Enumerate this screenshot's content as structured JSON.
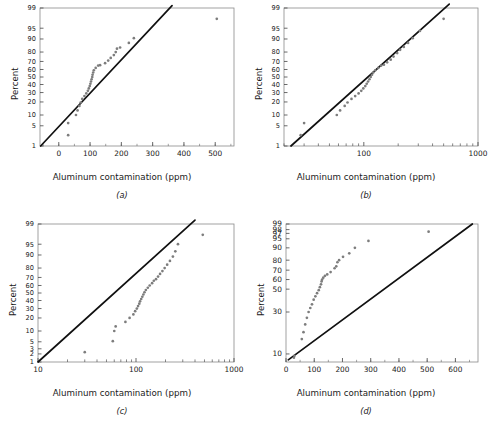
{
  "figure": {
    "axis_label_x": "Aluminum contamination (ppm)",
    "axis_label_y": "Percent",
    "marker_color": "#7d7d7d",
    "line_color": "#111111",
    "frame_color": "#8a8a8a",
    "background": "#ffffff"
  },
  "panels": [
    {
      "id": "a",
      "caption": "(a)",
      "chart_data": {
        "type": "scatter",
        "title": "",
        "xlabel": "Aluminum contamination (ppm)",
        "ylabel": "Percent",
        "x_scale": "linear",
        "y_scale": "normal-probability",
        "xlim": [
          -60,
          560
        ],
        "ylim": [
          1,
          99
        ],
        "grid": false,
        "legend": "none",
        "x_ticks": [
          0,
          100,
          200,
          300,
          400,
          500
        ],
        "x_tick_labels": [
          "0",
          "100",
          "200",
          "300",
          "400",
          "500"
        ],
        "y_ticks": [
          1,
          5,
          10,
          20,
          30,
          40,
          50,
          60,
          70,
          80,
          90,
          95,
          99
        ],
        "y_tick_labels": [
          "1",
          "5",
          "10",
          "20",
          "30",
          "40",
          "50",
          "60",
          "70",
          "80",
          "90",
          "95",
          "99"
        ],
        "points": [
          [
            30,
            2.5
          ],
          [
            30,
            6.0
          ],
          [
            55,
            10.0
          ],
          [
            60,
            13.0
          ],
          [
            66,
            16.5
          ],
          [
            70,
            19.5
          ],
          [
            75,
            23.0
          ],
          [
            82,
            26.0
          ],
          [
            88,
            29.0
          ],
          [
            93,
            32.0
          ],
          [
            96,
            35.0
          ],
          [
            99,
            38.0
          ],
          [
            101,
            41.0
          ],
          [
            103,
            44.0
          ],
          [
            105,
            47.0
          ],
          [
            107,
            50.0
          ],
          [
            108,
            53.0
          ],
          [
            110,
            56.0
          ],
          [
            112,
            59.0
          ],
          [
            118,
            62.0
          ],
          [
            126,
            65.0
          ],
          [
            132,
            65.5
          ],
          [
            148,
            68.0
          ],
          [
            158,
            71.0
          ],
          [
            166,
            74.0
          ],
          [
            176,
            77.0
          ],
          [
            182,
            80.0
          ],
          [
            186,
            83.0
          ],
          [
            196,
            84.0
          ],
          [
            224,
            87.5
          ],
          [
            240,
            90.5
          ],
          [
            505,
            97.5
          ]
        ],
        "fit_line": {
          "x0": -58,
          "y0": 1.0,
          "x1": 362,
          "y1": 99.2
        }
      }
    },
    {
      "id": "b",
      "caption": "(b)",
      "chart_data": {
        "type": "scatter",
        "title": "",
        "xlabel": "Aluminum contamination (ppm)",
        "ylabel": "Percent",
        "x_scale": "log",
        "y_scale": "normal-probability",
        "xlim": [
          20,
          1000
        ],
        "ylim": [
          1,
          99
        ],
        "grid": false,
        "legend": "none",
        "x_ticks": [
          100,
          1000
        ],
        "x_tick_labels": [
          "100",
          "1000"
        ],
        "y_ticks": [
          1,
          5,
          10,
          20,
          30,
          40,
          50,
          60,
          70,
          80,
          90,
          95,
          99
        ],
        "y_tick_labels": [
          "1",
          "5",
          "10",
          "20",
          "30",
          "40",
          "50",
          "60",
          "70",
          "80",
          "90",
          "95",
          "99"
        ],
        "points": [
          [
            28,
            2.5
          ],
          [
            30,
            6.0
          ],
          [
            58,
            10.0
          ],
          [
            62,
            13.0
          ],
          [
            68,
            16.5
          ],
          [
            72,
            19.5
          ],
          [
            78,
            23.0
          ],
          [
            84,
            26.0
          ],
          [
            90,
            29.0
          ],
          [
            95,
            32.0
          ],
          [
            99,
            35.0
          ],
          [
            103,
            38.0
          ],
          [
            106,
            41.0
          ],
          [
            109,
            44.0
          ],
          [
            112,
            47.0
          ],
          [
            115,
            50.0
          ],
          [
            118,
            53.0
          ],
          [
            121,
            56.0
          ],
          [
            126,
            59.0
          ],
          [
            134,
            62.0
          ],
          [
            142,
            65.0
          ],
          [
            150,
            66.0
          ],
          [
            160,
            69.0
          ],
          [
            172,
            72.0
          ],
          [
            182,
            75.5
          ],
          [
            196,
            79.0
          ],
          [
            208,
            82.0
          ],
          [
            224,
            84.5
          ],
          [
            244,
            87.5
          ],
          [
            268,
            90.5
          ],
          [
            310,
            94.0
          ],
          [
            500,
            97.5
          ]
        ],
        "fit_line": {
          "x0": 23,
          "y0": 1.0,
          "x1": 560,
          "y1": 99.3
        }
      }
    },
    {
      "id": "c",
      "caption": "(c)",
      "chart_data": {
        "type": "scatter",
        "title": "",
        "xlabel": "Aluminum contamination (ppm)",
        "ylabel": "Percent",
        "x_scale": "log",
        "y_scale": "lognormal-probability",
        "xlim": [
          10,
          1000
        ],
        "ylim": [
          1,
          99
        ],
        "grid": false,
        "legend": "none",
        "x_ticks": [
          10,
          100,
          1000
        ],
        "x_tick_labels": [
          "10",
          "100",
          "1000"
        ],
        "y_ticks": [
          1,
          2,
          3,
          5,
          10,
          20,
          30,
          40,
          50,
          60,
          70,
          80,
          90,
          95,
          99
        ],
        "y_tick_labels": [
          "1",
          "2",
          "3",
          "5",
          "10",
          "20",
          "30",
          "40",
          "50",
          "60",
          "70",
          "80",
          "90",
          "95",
          "99"
        ],
        "points": [
          [
            30,
            2.3
          ],
          [
            58,
            5.2
          ],
          [
            60,
            10.0
          ],
          [
            62,
            13.0
          ],
          [
            78,
            16.5
          ],
          [
            86,
            20.0
          ],
          [
            94,
            23.5
          ],
          [
            98,
            27.0
          ],
          [
            102,
            30.0
          ],
          [
            105,
            33.0
          ],
          [
            108,
            36.0
          ],
          [
            110,
            39.0
          ],
          [
            113,
            42.0
          ],
          [
            116,
            45.0
          ],
          [
            119,
            48.0
          ],
          [
            122,
            51.0
          ],
          [
            126,
            54.0
          ],
          [
            132,
            57.0
          ],
          [
            138,
            60.0
          ],
          [
            146,
            63.0
          ],
          [
            152,
            66.0
          ],
          [
            160,
            68.0
          ],
          [
            168,
            71.0
          ],
          [
            176,
            74.0
          ],
          [
            186,
            77.0
          ],
          [
            196,
            80.0
          ],
          [
            208,
            83.0
          ],
          [
            222,
            86.0
          ],
          [
            238,
            89.0
          ],
          [
            252,
            92.0
          ],
          [
            268,
            95.0
          ],
          [
            480,
            97.5
          ]
        ],
        "fit_line": {
          "x0": 10,
          "y0": 1.0,
          "x1": 400,
          "y1": 99.3
        }
      }
    },
    {
      "id": "d",
      "caption": "(d)",
      "chart_data": {
        "type": "scatter",
        "title": "",
        "xlabel": "Aluminum contamination (ppm)",
        "ylabel": "Percent",
        "x_scale": "linear",
        "y_scale": "weibull-probability",
        "xlim": [
          0,
          680
        ],
        "ylim": [
          8,
          99
        ],
        "grid": false,
        "legend": "none",
        "x_ticks": [
          0,
          100,
          200,
          300,
          400,
          500,
          600
        ],
        "x_tick_labels": [
          "0",
          "100",
          "200",
          "300",
          "400",
          "500",
          "600"
        ],
        "y_ticks": [
          10,
          30,
          50,
          60,
          70,
          80,
          90,
          95,
          97,
          98,
          99
        ],
        "y_tick_labels": [
          "10",
          "30",
          "50",
          "60",
          "70",
          "80",
          "90",
          "95",
          "97",
          "98",
          "99"
        ],
        "points": [
          [
            28,
            9.0
          ],
          [
            30,
            9.5
          ],
          [
            56,
            15.0
          ],
          [
            62,
            18.0
          ],
          [
            68,
            22.0
          ],
          [
            74,
            26.0
          ],
          [
            80,
            30.0
          ],
          [
            86,
            33.0
          ],
          [
            92,
            36.0
          ],
          [
            98,
            40.0
          ],
          [
            104,
            43.0
          ],
          [
            110,
            46.0
          ],
          [
            116,
            49.0
          ],
          [
            120,
            52.0
          ],
          [
            124,
            55.0
          ],
          [
            126,
            58.0
          ],
          [
            128,
            60.0
          ],
          [
            132,
            62.0
          ],
          [
            138,
            64.0
          ],
          [
            146,
            65.5
          ],
          [
            158,
            68.0
          ],
          [
            172,
            72.0
          ],
          [
            178,
            74.0
          ],
          [
            182,
            78.0
          ],
          [
            188,
            80.0
          ],
          [
            202,
            83.0
          ],
          [
            224,
            86.0
          ],
          [
            244,
            90.0
          ],
          [
            292,
            94.0
          ],
          [
            505,
            97.5
          ]
        ],
        "fit_line": {
          "x0": 8,
          "y0": 8.5,
          "x1": 660,
          "y1": 99.0
        }
      }
    }
  ]
}
